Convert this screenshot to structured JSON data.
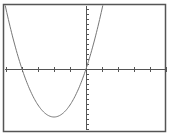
{
  "chart_data": {
    "type": "line",
    "title": "",
    "xlabel": "",
    "ylabel": "",
    "xlim": [
      -5,
      5
    ],
    "ylim": [
      -12,
      12
    ],
    "x_tick_step": 1,
    "y_tick_step": 1,
    "grid": false,
    "legend": null,
    "series": [
      {
        "name": "parabola",
        "equation_approx": "y = 2.4*x*(x+4)",
        "roots": [
          -4,
          0
        ],
        "vertex": [
          -2,
          -9.6
        ],
        "x": [
          -4.9,
          -4,
          -3,
          -2,
          -1,
          0,
          0.9
        ],
        "y": [
          8.6,
          0,
          -7.2,
          -9.6,
          -7.2,
          0,
          10.6
        ]
      }
    ]
  },
  "colors": {
    "frame": "#555555",
    "axis": "#555555",
    "curve": "#777777",
    "background": "#ffffff"
  }
}
